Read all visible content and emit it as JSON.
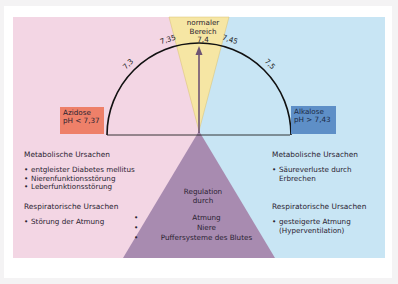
{
  "colors": {
    "acidosis_bg": "#f3d6e4",
    "alkalosis_bg": "#c8e5f4",
    "normal_bg": "#f6e6a4",
    "regulation_bg": "#a88bb0",
    "acidosis_box": "#ee8069",
    "alkalosis_box": "#5e8fc7",
    "arrow": "#6e5474",
    "arc": "#111111"
  },
  "normal_range": {
    "title_line1": "normaler",
    "title_line2": "Bereich",
    "value": "7,4"
  },
  "scale": {
    "ticks": [
      {
        "label": "7,3",
        "angle_deg": 135
      },
      {
        "label": "7,35",
        "angle_deg": 108
      },
      {
        "label": "7,45",
        "angle_deg": 72
      },
      {
        "label": "7,5",
        "angle_deg": 45
      }
    ]
  },
  "acidosis": {
    "label": "Azidose",
    "condition": "pH < 7,37",
    "metabolic": {
      "heading": "Metabolische Ursachen",
      "items": [
        "entgleister Diabetes mellitus",
        "Nierenfunktionsstörung",
        "Leberfunktionsstörung"
      ]
    },
    "respiratory": {
      "heading": "Respiratorische Ursachen",
      "items": [
        "Störung der Atmung"
      ]
    }
  },
  "alkalosis": {
    "label": "Alkalose",
    "condition": "pH > 7,43",
    "metabolic": {
      "heading": "Metabolische Ursachen",
      "items": [
        "Säureverluste durch",
        "Erbrechen"
      ]
    },
    "respiratory": {
      "heading": "Respiratorische Ursachen",
      "items": [
        "gesteigerte Atmung",
        "(Hyperventilation)"
      ]
    }
  },
  "regulation": {
    "title_line1": "Regulation",
    "title_line2": "durch",
    "items": [
      "Atmung",
      "Niere",
      "Puffersysteme des Blutes"
    ]
  }
}
